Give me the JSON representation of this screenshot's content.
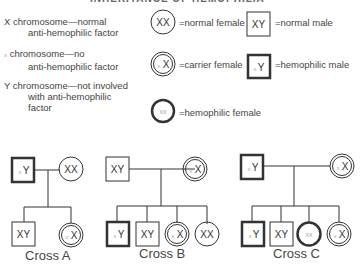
{
  "title": "INHERITANCE OF HEMOPHILIA",
  "legend": {
    "chromosomes": [
      {
        "symbol": "X",
        "line1": "chromosome—normal",
        "line2": "anti-hemophilic factor",
        "line3": ""
      },
      {
        "symbol": "x",
        "line1": "chromosome—no",
        "line2": "anti-hemophilic factor",
        "line3": ""
      },
      {
        "symbol": "Y",
        "line1": "chromosome—not involved",
        "line2": "with anti-hemophilic",
        "line3": "factor"
      }
    ],
    "symbols": [
      {
        "genotype": "XX",
        "shape": "circle",
        "label": "=normal female"
      },
      {
        "genotype": "XY",
        "shape": "square",
        "label": "=normal male"
      },
      {
        "genotype": "xX",
        "shape": "double-circle",
        "label": "=carrier female"
      },
      {
        "genotype": "xY",
        "shape": "thick-square",
        "label": "=hemophilic male"
      },
      {
        "genotype": "xx",
        "shape": "thick-circle",
        "label": "=hemophilic female"
      }
    ]
  },
  "crosses": [
    {
      "label": "Cross A",
      "parents": [
        {
          "genotype": "xY",
          "type": "hemophilic male"
        },
        {
          "genotype": "XX",
          "type": "normal female"
        }
      ],
      "children": [
        {
          "genotype": "XY",
          "type": "normal male"
        },
        {
          "genotype": "xX",
          "type": "carrier female"
        }
      ]
    },
    {
      "label": "Cross B",
      "parents": [
        {
          "genotype": "XY",
          "type": "normal male"
        },
        {
          "genotype": "xX",
          "type": "carrier female"
        }
      ],
      "children": [
        {
          "genotype": "xY",
          "type": "hemophilic male"
        },
        {
          "genotype": "XY",
          "type": "normal male"
        },
        {
          "genotype": "xX",
          "type": "carrier female"
        },
        {
          "genotype": "XX",
          "type": "normal female"
        }
      ]
    },
    {
      "label": "Cross C",
      "parents": [
        {
          "genotype": "xY",
          "type": "hemophilic male"
        },
        {
          "genotype": "xX",
          "type": "carrier female"
        }
      ],
      "children": [
        {
          "genotype": "xY",
          "type": "hemophilic male"
        },
        {
          "genotype": "XY",
          "type": "normal male"
        },
        {
          "genotype": "xx",
          "type": "hemophilic female"
        },
        {
          "genotype": "xX",
          "type": "carrier female"
        }
      ]
    }
  ],
  "colors": {
    "line": "#333333",
    "faint": "#aaaaaa",
    "text": "#444444"
  }
}
